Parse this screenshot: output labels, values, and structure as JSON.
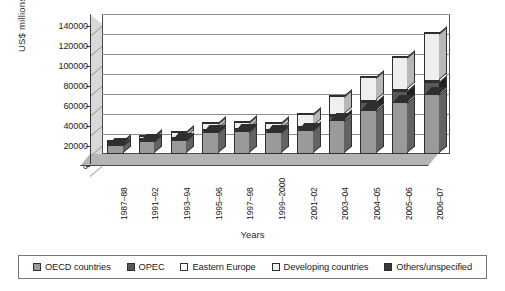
{
  "chart_data": {
    "type": "bar",
    "subtype": "stacked-column-3d",
    "title": "",
    "xlabel": "Years",
    "ylabel": "US$ millions",
    "ylim": [
      0,
      140000
    ],
    "ytick_step": 20000,
    "yticks": [
      "0",
      "20000",
      "40000",
      "60000",
      "80000",
      "100000",
      "120000",
      "140000"
    ],
    "grid": true,
    "legend_position": "bottom",
    "categories": [
      "1987–88",
      "1991–92",
      "1993–94",
      "1995–96",
      "1997–98",
      "1999–2000",
      "2001–02",
      "2003–04",
      "2004–05",
      "2005–06",
      "2006–07"
    ],
    "series": [
      {
        "name": "OECD countries",
        "color": "#9a9a9a",
        "values": [
          9000,
          13000,
          14000,
          22000,
          23000,
          22000,
          24000,
          34000,
          44000,
          52000,
          60000
        ]
      },
      {
        "name": "OPEC",
        "color": "#585858",
        "values": [
          1500,
          1800,
          2000,
          2500,
          2500,
          2500,
          3000,
          5000,
          9000,
          12000,
          13000
        ]
      },
      {
        "name": "Eastern Europe",
        "color": "#ffffff",
        "values": [
          500,
          1500,
          1500,
          1500,
          1500,
          1500,
          1500,
          1500,
          1500,
          2000,
          2000
        ]
      },
      {
        "name": "Developing countries",
        "color": "#efefef",
        "values": [
          1000,
          3500,
          6000,
          7000,
          7000,
          7000,
          13000,
          19000,
          24000,
          33000,
          48000
        ]
      },
      {
        "name": "Others/unspecified",
        "color": "#3a3a3a",
        "values": [
          1000,
          1200,
          1200,
          1500,
          1500,
          1500,
          1500,
          1500,
          1500,
          2000,
          2000
        ]
      }
    ],
    "totals": [
      13000,
      21000,
      24700,
      34500,
      35500,
      34500,
      43000,
      61000,
      80000,
      101000,
      125000
    ]
  },
  "legend": {
    "items": [
      {
        "label": "OECD countries",
        "color": "#9a9a9a"
      },
      {
        "label": "OPEC",
        "color": "#585858"
      },
      {
        "label": "Eastern Europe",
        "color": "#ffffff"
      },
      {
        "label": "Developing countries",
        "color": "#efefef"
      },
      {
        "label": "Others/unspecified",
        "color": "#3a3a3a"
      }
    ]
  }
}
